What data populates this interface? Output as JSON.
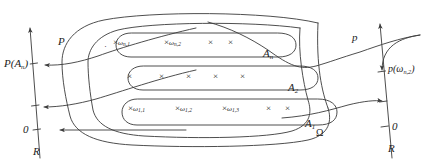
{
  "figure": {
    "type": "measure-theory-diagram",
    "stroke_color": "#3a3a3a",
    "text_color": "#1a1a1a"
  },
  "left_axis": {
    "name": "R",
    "zero_label": "0",
    "axis_label": "R",
    "map_label": "P",
    "value_label": "P(A",
    "value_label_sub": "n",
    "value_label_tail": ")"
  },
  "right_axis": {
    "name": "R",
    "zero_label": "0",
    "axis_label": "R",
    "map_label": "p",
    "value_label": "p(ω",
    "value_label_sub": "n,2",
    "value_label_tail": ")"
  },
  "universe": {
    "label": "Ω"
  },
  "sets": [
    {
      "id": "An",
      "label": "A",
      "label_sub": "n",
      "points": [
        {
          "glyph": "·",
          "label": "",
          "label_sub": ""
        },
        {
          "glyph": "×",
          "label": "ω",
          "label_sub": "n,1"
        },
        {
          "glyph": "×",
          "label": "ω",
          "label_sub": "n,2"
        },
        {
          "glyph": "×",
          "label": "",
          "label_sub": ""
        },
        {
          "glyph": "×",
          "label": "",
          "label_sub": ""
        }
      ]
    },
    {
      "id": "A2",
      "label": "A",
      "label_sub": "2",
      "points": [
        {
          "glyph": "×",
          "label": "",
          "label_sub": ""
        },
        {
          "glyph": "×",
          "label": "",
          "label_sub": ""
        },
        {
          "glyph": "×",
          "label": "",
          "label_sub": ""
        },
        {
          "glyph": "×",
          "label": "",
          "label_sub": ""
        },
        {
          "glyph": "×",
          "label": "",
          "label_sub": ""
        }
      ]
    },
    {
      "id": "A1",
      "label": "A",
      "label_sub": "1",
      "points": [
        {
          "glyph": "×",
          "label": "ω",
          "label_sub": "1,1"
        },
        {
          "glyph": "×",
          "label": "ω",
          "label_sub": "1,2"
        },
        {
          "glyph": "×",
          "label": "ω",
          "label_sub": "1,3"
        },
        {
          "glyph": "×",
          "label": "",
          "label_sub": ""
        },
        {
          "glyph": "×",
          "label": "",
          "label_sub": ""
        }
      ]
    }
  ]
}
